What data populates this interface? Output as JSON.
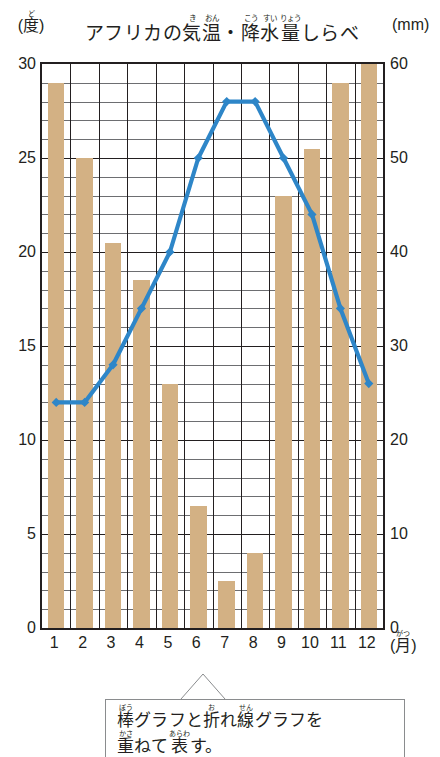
{
  "title": {
    "segments": [
      {
        "base": "アフリカの",
        "ruby": ""
      },
      {
        "base": "気",
        "ruby": "き"
      },
      {
        "base": "温",
        "ruby": "おん"
      },
      {
        "base": "・",
        "ruby": ""
      },
      {
        "base": "降",
        "ruby": "こう"
      },
      {
        "base": "水",
        "ruby": "すい"
      },
      {
        "base": "量",
        "ruby": "りょう"
      },
      {
        "base": "しらべ",
        "ruby": ""
      }
    ],
    "plain": "アフリカの気温・降水量しらべ"
  },
  "axes": {
    "left_unit_base": "(度)",
    "left_unit_ruby": "ど",
    "right_unit": "(mm)",
    "x_unit_base": "(月)",
    "x_unit_ruby": "がつ",
    "left_ticks": [
      "30",
      "25",
      "20",
      "15",
      "10",
      "5",
      "0"
    ],
    "right_ticks": [
      "60",
      "50",
      "40",
      "30",
      "20",
      "10",
      "0"
    ],
    "left_min": 0,
    "left_max": 30,
    "right_min": 0,
    "right_max": 60
  },
  "caption": {
    "line1": [
      {
        "base": "棒",
        "ruby": "ぼう"
      },
      {
        "base": "グラフと",
        "ruby": ""
      },
      {
        "base": "折",
        "ruby": "お"
      },
      {
        "base": "れ",
        "ruby": ""
      },
      {
        "base": "線",
        "ruby": "せん"
      },
      {
        "base": "グラフを",
        "ruby": ""
      }
    ],
    "line2": [
      {
        "base": "重",
        "ruby": "かさ"
      },
      {
        "base": "ねて",
        "ruby": ""
      },
      {
        "base": "表",
        "ruby": "あらわ"
      },
      {
        "base": "す。",
        "ruby": ""
      }
    ],
    "plain": "棒グラフと折れ線グラフを重ねて表す。"
  },
  "colors": {
    "bar": "#d3b184",
    "line": "#2e86c8",
    "axis": "#231f20",
    "grid_minor": "#6d6e71"
  },
  "chart_data": {
    "type": "bar",
    "xlabel": "(月)",
    "ylabel": "(度)",
    "y2label": "(mm)",
    "categories": [
      "1",
      "2",
      "3",
      "4",
      "5",
      "6",
      "7",
      "8",
      "9",
      "10",
      "11",
      "12"
    ],
    "series": [
      {
        "name": "降水量",
        "type": "bar",
        "unit": "mm",
        "axis": "right",
        "values": [
          58,
          50,
          41,
          37,
          26,
          13,
          5,
          8,
          46,
          51,
          58,
          60
        ]
      },
      {
        "name": "気温",
        "type": "line",
        "unit": "度",
        "axis": "left",
        "values": [
          12,
          12,
          14,
          17,
          20,
          25,
          28,
          28,
          25,
          22,
          17,
          13
        ]
      }
    ],
    "ylim": [
      0,
      30
    ],
    "y2lim": [
      0,
      60
    ],
    "grid": true,
    "legend": "none"
  }
}
